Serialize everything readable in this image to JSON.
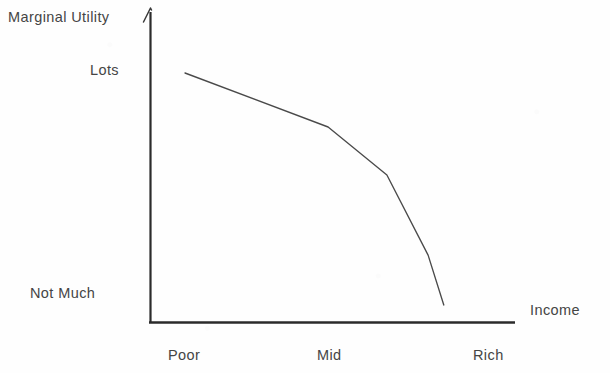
{
  "chart_data": {
    "type": "line",
    "title": "",
    "subtitle": "",
    "xlabel": "Income",
    "ylabel": "Marginal Utility",
    "grid": false,
    "legend": null,
    "x_tick_labels": [
      "Poor",
      "Mid",
      "Rich"
    ],
    "y_tick_labels": [
      "Not Much",
      "Lots"
    ],
    "xlim": [
      0,
      100
    ],
    "ylim": [
      0,
      100
    ],
    "annotations": [],
    "series": [
      {
        "name": "Marginal utility of income",
        "color": "#4a4a4a",
        "points": [
          {
            "x": 9.6,
            "y": 79.3,
            "x_label": "Poor"
          },
          {
            "x": 48.8,
            "y": 62.1,
            "x_label": "Mid"
          },
          {
            "x": 64.9,
            "y": 46.8,
            "x_label": ""
          },
          {
            "x": 76.2,
            "y": 21.3,
            "x_label": ""
          },
          {
            "x": 80.5,
            "y": 5.4,
            "x_label": ""
          }
        ]
      }
    ]
  },
  "axes": {
    "y_axis_label": "Marginal Utility",
    "x_axis_label": "Income",
    "y_ticks": [
      {
        "label": "Lots"
      },
      {
        "label": "Not Much"
      }
    ],
    "x_ticks": [
      {
        "label": "Poor"
      },
      {
        "label": "Mid"
      },
      {
        "label": "Rich"
      }
    ],
    "axis_color": "#2b2b2b",
    "curve_color": "#4a4a4a",
    "background_color": "#fefefe",
    "text_color": "#454545"
  }
}
